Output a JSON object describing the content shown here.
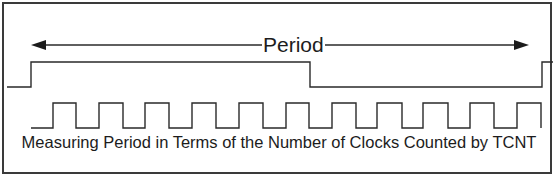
{
  "diagram": {
    "title": "Measuring Period in Terms of the Number of Clocks Counted by TCNT",
    "period_label": "Period",
    "colors": {
      "line": "#2a2a2a",
      "border": "#3a3a3a",
      "background": "#ffffff",
      "text": "#1c1c1c"
    },
    "signals": [
      {
        "name": "input-signal",
        "description": "Measured signal: low, rises (start of period), falls, rises again (end of period)",
        "edges": [
          "rise",
          "fall",
          "rise"
        ]
      },
      {
        "name": "tcnt-clock",
        "description": "Clock counted by TCNT during the period",
        "pulse_count": 11
      }
    ],
    "arrow": {
      "type": "double-headed",
      "label": "Period",
      "spans": "from first rising edge to next rising edge of input signal"
    }
  }
}
